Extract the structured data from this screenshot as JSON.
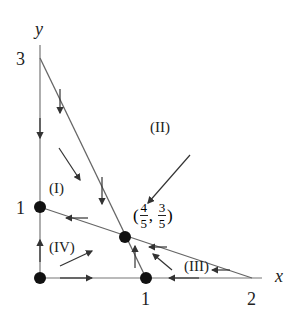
{
  "axes": {
    "x_label": "x",
    "y_label": "y",
    "x_ticks": [
      "1",
      "2"
    ],
    "y_ticks": [
      "1",
      "3"
    ]
  },
  "regions": {
    "I": "(I)",
    "II": "(II)",
    "III": "(III)",
    "IV": "(IV)"
  },
  "equilibrium": {
    "label_open": "(",
    "x_num": "4",
    "x_den": "5",
    "comma": ",",
    "y_num": "3",
    "y_den": "5",
    "label_close": ")"
  },
  "colors": {
    "line": "#555555",
    "dot": "#111111",
    "text": "#222222"
  }
}
